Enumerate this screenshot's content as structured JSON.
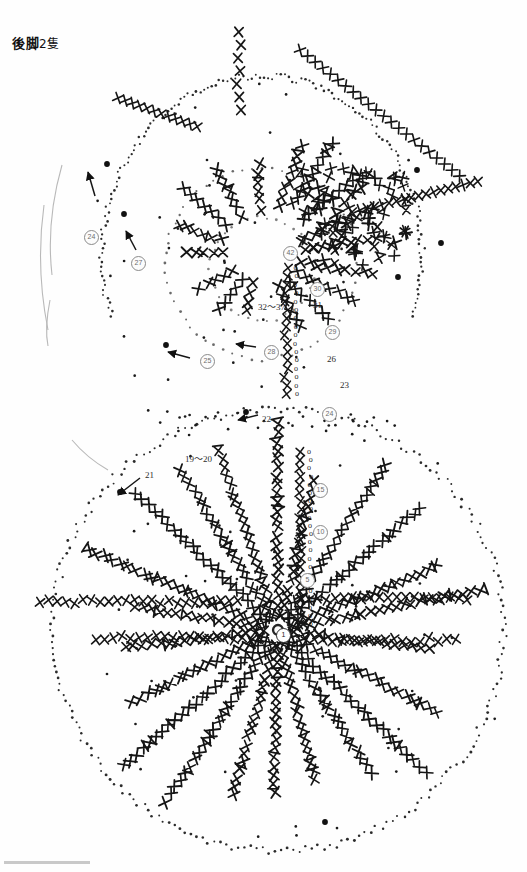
{
  "document": {
    "title": "後脚 2隻",
    "title_main": "後脚",
    "title_count": "2隻",
    "kind": "crochet-pattern-chart",
    "language": "ja",
    "page_background": "#ffffff",
    "ink_color": "#1a1a1a",
    "marker_color": "#7a7a7a"
  },
  "legend_symbols": {
    "x_stitch": "X",
    "chain_stitch": "o",
    "slip_stitch": "•",
    "increase_pair": "丂",
    "decrease_pair": "刀"
  },
  "round_labels": [
    {
      "id": "r32_37",
      "text": "32〜37",
      "x": 258,
      "y": 300
    },
    {
      "id": "r31",
      "text": "31",
      "x": 313,
      "y": 300
    },
    {
      "id": "r26",
      "text": "26",
      "x": 327,
      "y": 354
    },
    {
      "id": "r23",
      "text": "23",
      "x": 340,
      "y": 380
    },
    {
      "id": "r22",
      "text": "22",
      "x": 262,
      "y": 414
    },
    {
      "id": "r21",
      "text": "21",
      "x": 145,
      "y": 470
    },
    {
      "id": "r19_20",
      "text": "19〜20",
      "x": 185,
      "y": 452
    }
  ],
  "round_markers": [
    {
      "id": "m24",
      "text": "24",
      "x": 84,
      "y": 230,
      "emphasis": "light"
    },
    {
      "id": "m27",
      "text": "27",
      "x": 131,
      "y": 256,
      "emphasis": "light"
    },
    {
      "id": "m42",
      "text": "42",
      "x": 283,
      "y": 246,
      "emphasis": "light"
    },
    {
      "id": "m30",
      "text": "30",
      "x": 310,
      "y": 282,
      "emphasis": "light"
    },
    {
      "id": "m29",
      "text": "29",
      "x": 325,
      "y": 325,
      "emphasis": "light"
    },
    {
      "id": "m28",
      "text": "28",
      "x": 264,
      "y": 345,
      "emphasis": "light"
    },
    {
      "id": "m25",
      "text": "25",
      "x": 200,
      "y": 354,
      "emphasis": "light"
    },
    {
      "id": "m24b",
      "text": "24",
      "x": 322,
      "y": 407,
      "emphasis": "light"
    },
    {
      "id": "m15",
      "text": "15",
      "x": 313,
      "y": 483,
      "emphasis": "light"
    },
    {
      "id": "m10",
      "text": "10",
      "x": 313,
      "y": 525,
      "emphasis": "light"
    },
    {
      "id": "m5",
      "text": "5",
      "x": 300,
      "y": 573,
      "emphasis": "light"
    },
    {
      "id": "m1",
      "text": "1",
      "x": 276,
      "y": 628,
      "emphasis": "dark"
    }
  ],
  "arrows": [
    {
      "id": "arrow-21",
      "from": [
        140,
        478
      ],
      "to": [
        118,
        495
      ]
    },
    {
      "id": "arrow-22",
      "from": [
        258,
        415
      ],
      "to": [
        238,
        420
      ]
    },
    {
      "id": "arrow-25",
      "from": [
        190,
        358
      ],
      "to": [
        168,
        352
      ]
    },
    {
      "id": "arrow-28",
      "from": [
        256,
        347
      ],
      "to": [
        236,
        344
      ]
    },
    {
      "id": "arrow-27",
      "from": [
        136,
        250
      ],
      "to": [
        126,
        231
      ]
    },
    {
      "id": "arrow-24",
      "from": [
        95,
        196
      ],
      "to": [
        88,
        172
      ]
    }
  ],
  "motifs": [
    {
      "id": "upper-motif",
      "label": "upper circular motif",
      "center": [
        262,
        255
      ],
      "radius": 160,
      "outline": "dotted",
      "spokes": 9
    },
    {
      "id": "lower-motif",
      "label": "lower circular motif",
      "center": [
        278,
        630
      ],
      "radius": 228,
      "outline": "dotted",
      "spokes": 22
    }
  ],
  "pencil_marks": [
    {
      "id": "pencil-arc-1",
      "d": "M 62 165 C 52 200, 48 240, 52 275"
    },
    {
      "id": "pencil-arc-2",
      "d": "M 44 205 C 38 248, 40 290, 48 330"
    },
    {
      "id": "pencil-arc-3",
      "d": "M 50 300 C 46 320, 46 336, 48 346"
    },
    {
      "id": "pencil-arc-4",
      "d": "M 72 440 C 82 452, 94 462, 108 470"
    }
  ],
  "footer": {
    "rule_visible": true
  }
}
